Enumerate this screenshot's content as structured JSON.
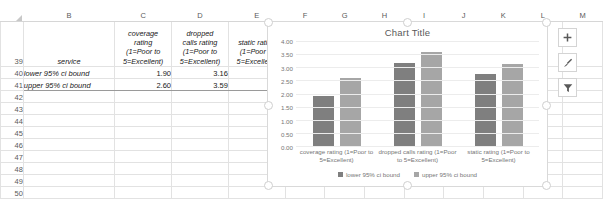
{
  "spreadsheet": {
    "columns": [
      "B",
      "C",
      "D",
      "E",
      "F",
      "G",
      "H",
      "I",
      "J",
      "K",
      "L",
      "M"
    ],
    "row_numbers": [
      "39",
      "40",
      "41",
      "42",
      "43",
      "44",
      "45",
      "46",
      "47",
      "48",
      "49",
      "50"
    ],
    "header_row": {
      "row": "39",
      "b": "service",
      "c": [
        "coverage",
        "rating",
        "(1=Poor to",
        "5=Excellent)"
      ],
      "d": [
        "dropped",
        "calls rating",
        "(1=Poor to",
        "5=Excellent)"
      ],
      "e": [
        "static   rating",
        "(1=Poor to",
        "5=Excellent)"
      ]
    },
    "data_rows": [
      {
        "row": "40",
        "label": "lower 95% ci bound",
        "c": "1.90",
        "d": "3.16",
        "e": "2.73"
      },
      {
        "row": "41",
        "label": "upper 95% ci bound",
        "c": "2.60",
        "d": "3.59",
        "e": "3.14"
      }
    ]
  },
  "chart_buttons": [
    {
      "name": "chart-elements-button",
      "icon": "plus-icon"
    },
    {
      "name": "chart-styles-button",
      "icon": "brush-icon"
    },
    {
      "name": "chart-filters-button",
      "icon": "funnel-icon"
    }
  ],
  "chart_data": {
    "type": "bar",
    "title": "Chart Title",
    "categories": [
      "coverage rating (1=Poor to 5=Excellent)",
      "dropped calls rating (1=Poor to 5=Excellent)",
      "static  rating (1=Poor to 5=Excellent)"
    ],
    "series": [
      {
        "name": "lower 95% ci bound",
        "values": [
          1.9,
          3.16,
          2.73
        ],
        "color": "#7f7f7f"
      },
      {
        "name": "upper 95% ci bound",
        "values": [
          2.6,
          3.59,
          3.14
        ],
        "color": "#a6a6a6"
      }
    ],
    "xlabel": "",
    "ylabel": "",
    "ylim": [
      0,
      4
    ],
    "ytick_labels": [
      "4.00",
      "3.50",
      "3.00",
      "2.50",
      "2.00",
      "1.50",
      "1.00",
      "0.50",
      "0.00"
    ],
    "ytick_values": [
      4.0,
      3.5,
      3.0,
      2.5,
      2.0,
      1.5,
      1.0,
      0.5,
      0.0
    ],
    "grid": true,
    "legend_position": "bottom"
  }
}
